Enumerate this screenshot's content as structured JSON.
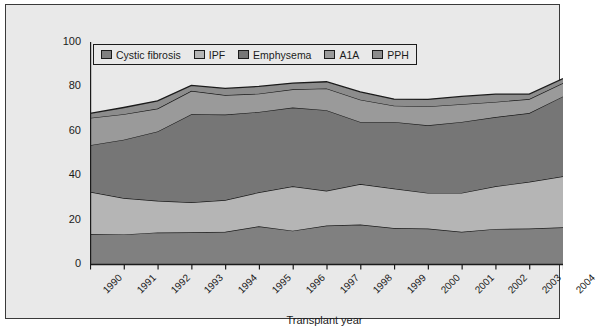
{
  "figure": {
    "background": "#e9e9e9",
    "border_color": "#3a3a3a"
  },
  "axes": {
    "y_label": "% of transplants",
    "x_label": "Transplant year",
    "y_ticks": [
      "0",
      "20",
      "40",
      "60",
      "80",
      "100"
    ],
    "x_ticks": [
      "1990",
      "1991",
      "1992",
      "1993",
      "1994",
      "1995",
      "1996",
      "1997",
      "1998",
      "1999",
      "2000",
      "2001",
      "2002",
      "2003",
      "2004"
    ]
  },
  "legend": {
    "items": [
      {
        "label": "Cystic fibrosis",
        "color": "#808080"
      },
      {
        "label": "IPF",
        "color": "#b5b5b5"
      },
      {
        "label": "Emphysema",
        "color": "#767676"
      },
      {
        "label": "A1A",
        "color": "#9a9a9a"
      },
      {
        "label": "PPH",
        "color": "#8c8c8c"
      }
    ]
  },
  "chart_data": {
    "type": "area",
    "stacked": true,
    "title": "",
    "xlabel": "Transplant year",
    "ylabel": "% of transplants",
    "xlim": [
      1990,
      2004
    ],
    "ylim": [
      0,
      100
    ],
    "grid": false,
    "legend_position": "top-left-inside",
    "categories": [
      "1990",
      "1991",
      "1992",
      "1993",
      "1994",
      "1995",
      "1996",
      "1997",
      "1998",
      "1999",
      "2000",
      "2001",
      "2002",
      "2003",
      "2004"
    ],
    "series": [
      {
        "name": "Cystic fibrosis",
        "color": "#808080",
        "values": [
          13.5,
          13.3,
          14.2,
          14.3,
          14.5,
          17.0,
          15.0,
          17.3,
          17.8,
          16.2,
          16.0,
          14.5,
          15.8,
          16.0,
          16.5
        ]
      },
      {
        "name": "IPF",
        "color": "#b5b5b5",
        "values": [
          19.0,
          16.4,
          14.3,
          13.5,
          14.3,
          15.3,
          20.0,
          15.7,
          18.2,
          17.8,
          16.0,
          17.5,
          19.2,
          21.0,
          23.0
        ]
      },
      {
        "name": "Emphysema",
        "color": "#767676",
        "values": [
          21.0,
          26.3,
          31.2,
          39.7,
          38.5,
          36.2,
          35.5,
          36.3,
          28.0,
          30.0,
          30.5,
          32.0,
          31.2,
          31.0,
          36.0
        ]
      },
      {
        "name": "A1A",
        "color": "#9a9a9a",
        "values": [
          12.3,
          11.5,
          10.3,
          10.5,
          8.8,
          8.2,
          8.2,
          9.8,
          10.0,
          7.3,
          8.5,
          8.0,
          6.8,
          6.3,
          6.0
        ]
      },
      {
        "name": "PPH",
        "color": "#8c8c8c",
        "values": [
          2.0,
          3.0,
          3.5,
          2.5,
          3.0,
          3.3,
          2.8,
          3.0,
          3.5,
          3.0,
          3.2,
          3.5,
          3.5,
          2.2,
          2.0
        ]
      }
    ],
    "cumulative_tops": {
      "Cystic fibrosis": [
        13.5,
        13.3,
        14.2,
        14.3,
        14.5,
        17.0,
        15.0,
        17.3,
        17.8,
        16.2,
        16.0,
        14.5,
        15.8,
        16.0,
        16.5
      ],
      "IPF": [
        32.5,
        29.7,
        28.5,
        27.8,
        28.8,
        32.3,
        35.0,
        33.0,
        36.0,
        34.0,
        32.0,
        32.0,
        35.0,
        37.0,
        39.5
      ],
      "Emphysema": [
        53.5,
        56.0,
        59.7,
        67.5,
        67.3,
        68.5,
        70.5,
        69.3,
        74.0,
        74.0,
        72.5,
        74.0,
        74.5,
        75.0,
        75.5
      ],
      "A1A": [
        69.8,
        69.0,
        72.5,
        78.0,
        76.1,
        78.9,
        78.7,
        79.0,
        84.0,
        81.3,
        81.0,
        82.0,
        81.3,
        81.3,
        81.5
      ],
      "PPH": [
        82.0,
        80.7,
        85.5,
        84.8,
        83.1,
        84.9,
        84.2,
        82.5,
        87.2,
        84.2,
        84.0,
        84.5,
        85.0,
        83.5,
        83.5
      ]
    }
  }
}
